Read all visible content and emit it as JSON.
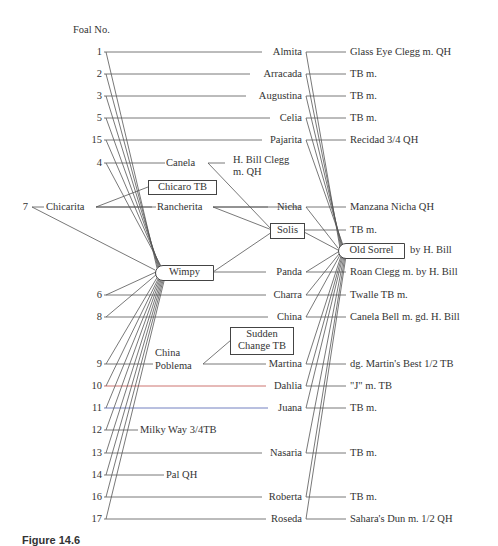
{
  "header": {
    "title": "Foal No."
  },
  "colors": {
    "line": "#555555",
    "line_10": "#c0504d",
    "line_11": "#4f5fb0"
  },
  "foals": [
    {
      "no": "1",
      "dam": "Almita",
      "dam_sire": "Glass Eye Clegg m. QH"
    },
    {
      "no": "2",
      "dam": "Arracada",
      "dam_sire": "TB m."
    },
    {
      "no": "3",
      "dam": "Augustina",
      "dam_sire": "TB m."
    },
    {
      "no": "5",
      "dam": "Celia",
      "dam_sire": "TB m."
    },
    {
      "no": "15",
      "dam": "Pajarita",
      "dam_sire": "Recidad 3/4 QH"
    },
    {
      "no": "4",
      "dam": "Canela",
      "dam_sire": "H. Bill Clegg m. QH"
    },
    {
      "no": "7",
      "dam": "Chicarita",
      "dam_sire": "Chicaro TB"
    },
    {
      "no": "6",
      "dam": "Charra",
      "dam_sire": "Twalle TB m."
    },
    {
      "no": "8",
      "dam": "China",
      "dam_sire": "Canela Bell m. gd. H. Bill"
    },
    {
      "no": "9",
      "dam": "China Poblema",
      "dam_sire": "Sudden Change TB"
    },
    {
      "no": "10",
      "dam": "Dahlia",
      "dam_sire": "\"J\" m. TB"
    },
    {
      "no": "11",
      "dam": "Juana",
      "dam_sire": "TB m."
    },
    {
      "no": "12",
      "dam": "Milky Way 3/4TB",
      "dam_sire": ""
    },
    {
      "no": "13",
      "dam": "Nasaria",
      "dam_sire": "TB m."
    },
    {
      "no": "14",
      "dam": "Pal QH",
      "dam_sire": ""
    },
    {
      "no": "16",
      "dam": "Roberta",
      "dam_sire": "TB m."
    },
    {
      "no": "17",
      "dam": "Roseda",
      "dam_sire": "Sahara's Dun m. 1/2 QH"
    }
  ],
  "nodes": {
    "wimpy": "Wimpy",
    "solis": "Solis",
    "old_sorrel": "Old Sorrel",
    "old_sorrel_suffix": "by H. Bill",
    "chicaro": "Chicaro TB",
    "sudden_change_1": "Sudden",
    "sudden_change_2": "Change TB",
    "h_bill_clegg_1": "H. Bill Clegg",
    "h_bill_clegg_2": "m. QH",
    "rancherita": "Rancherita",
    "nicha": "Nicha",
    "manzana_nicha": "Manzana Nicha QH",
    "solis_dam": "TB m.",
    "panda": "Panda",
    "roan_clegg": "Roan Clegg m. by H. Bill",
    "china_poblema_1": "China",
    "china_poblema_2": "Poblema",
    "martina": "Martina",
    "martina_dam": "dg. Martin's Best  1/2 TB"
  },
  "caption": "Figure 14.6"
}
